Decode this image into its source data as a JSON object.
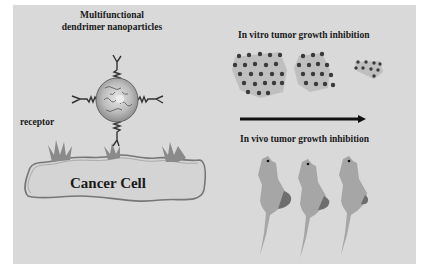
{
  "nanoparticle": {
    "title_line1": "Multifunctional",
    "title_line2": "dendrimer nanoparticles",
    "ligand_icon": "y-shaped-targeting-ligand",
    "core_icon": "dendrimer-sphere"
  },
  "cell": {
    "receptor_label": "receptor",
    "label": "Cancer Cell",
    "receptor_count": 3
  },
  "in_vitro": {
    "label": "In vitro tumor growth inhibition",
    "clusters": [
      {
        "name": "large",
        "dot_count": 25
      },
      {
        "name": "medium",
        "dot_count": 17
      },
      {
        "name": "small",
        "dot_count": 9
      }
    ]
  },
  "arrow": {
    "direction": "right",
    "meaning": "treatment progression"
  },
  "in_vivo": {
    "label": "In vivo tumor growth inhibition",
    "mice": [
      {
        "name": "mouse-1",
        "tumor_size": "large"
      },
      {
        "name": "mouse-2",
        "tumor_size": "medium"
      },
      {
        "name": "mouse-3",
        "tumor_size": "small"
      }
    ]
  },
  "colors": {
    "panel": "#d9d9d9",
    "text": "#1a1a1a",
    "cell_fill": "#d4d4d4",
    "receptor": "#8a8a8a",
    "mouse": "#a6a6a6",
    "tumor": "#6e6e6e",
    "dot": "#3a3a3a",
    "dot_halo": "#b3b3b3"
  }
}
